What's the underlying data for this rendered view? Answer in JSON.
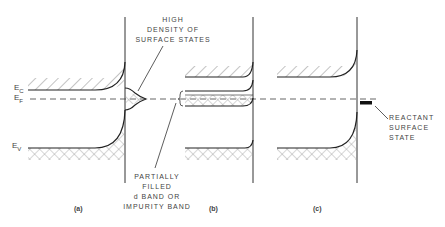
{
  "figure": {
    "energy_labels": {
      "ec": "E",
      "ec_sub": "C",
      "ef": "E",
      "ef_sub": "F",
      "ev": "E",
      "ev_sub": "V"
    },
    "annotations": {
      "surface_states": [
        "HIGH",
        "DENSITY OF",
        "SURFACE STATES"
      ],
      "partial_band": [
        "PARTIALLY",
        "FILLED",
        "d BAND OR",
        "IMPURITY BAND"
      ],
      "reactant": [
        "REACTANT",
        "SURFACE",
        "STATE"
      ]
    },
    "panels": [
      {
        "label": "(a)"
      },
      {
        "label": "(b)"
      },
      {
        "label": "(c)"
      }
    ],
    "caption": "Fig. ... (partially cropped caption line, illegible)"
  }
}
